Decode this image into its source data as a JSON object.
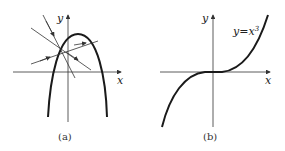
{
  "panels": [
    {
      "caption": "(a)",
      "x_label": "x",
      "y_label": "y",
      "curve": "downward-opening parabola",
      "lines": 3
    },
    {
      "caption": "(b)",
      "x_label": "x",
      "y_label": "y",
      "curve_label": "y=x",
      "curve_label_exp": "3"
    }
  ],
  "colors": {
    "stroke": "#1a1a1a",
    "axis": "#333333",
    "background": "#ffffff"
  }
}
